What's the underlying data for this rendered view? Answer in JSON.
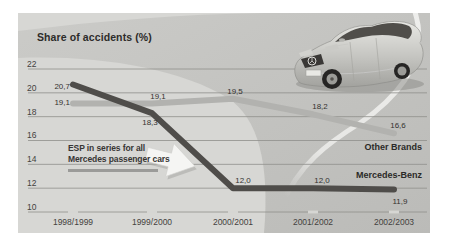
{
  "title": "Share of accidents (%)",
  "chart_data": {
    "type": "line",
    "title": "Share of accidents (%)",
    "categories": [
      "1998/1999",
      "1999/2000",
      "2000/2001",
      "2001/2002",
      "2002/2003"
    ],
    "yticks": [
      22,
      20,
      18,
      16,
      14,
      12,
      10
    ],
    "ylim": [
      10,
      22
    ],
    "grid": true,
    "legend_position": "inline-right",
    "series": [
      {
        "name": "Other Brands",
        "color": "#b2b2af",
        "values": [
          19.1,
          19.1,
          19.5,
          18.2,
          16.6
        ],
        "point_labels": [
          "19,1",
          "19,1",
          "19,5",
          "18,2",
          "16,6"
        ]
      },
      {
        "name": "Mercedes-Benz",
        "color": "#4f4d4a",
        "values": [
          20.7,
          18.3,
          12.0,
          12.0,
          11.9
        ],
        "point_labels": [
          "20,7",
          "18,3",
          "12,0",
          "12,0",
          "11,9"
        ]
      }
    ],
    "annotation": {
      "line1": "ESP in series for all",
      "line2": "Mercedes passenger cars"
    }
  },
  "colors": {
    "panel_bg": "#d6d6d3",
    "ground": "#d7d7d4",
    "road": "#c8c8c5",
    "road_dark": "#bcbcb9",
    "gridline": "#8f8f8c",
    "lane_marking": "#efefed",
    "text": "#3a3a38",
    "callout_bar": "#9b9b99",
    "arrow_fill": "#f5f5f3",
    "car_body_silver": "#c9c9c5"
  }
}
